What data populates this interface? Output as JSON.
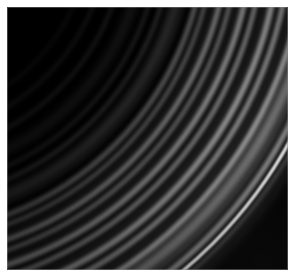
{
  "image": {
    "kind": "natural-image",
    "subject": "saturn-ring-system-closeup",
    "alt_text": "Grayscale spacecraft photograph of a portion of Saturn's ring system: many thin concentric bright arcs curving from the upper right down to the lower left across a black sky, with one very bright narrow outermost ringlet.",
    "orientation": "landscape",
    "width_px": 295,
    "height_px": 276,
    "color_mode": "grayscale",
    "background_color": "#000000",
    "frame_color": "#ffffff",
    "frame_inset_px": 7,
    "photo_width_px": 281,
    "photo_height_px": 263
  },
  "scene": {
    "arc_center_x": -112,
    "arc_center_y": -82,
    "description": "Concentric ring arcs share a common center off the upper-left of the frame; radius increases toward the lower-right, so bands sweep from top-right to bottom-left.",
    "space_color": "#000000",
    "brightest_ring_color": "#f2f2f2"
  },
  "rings": [
    {
      "name": "inner-faint-arc-1",
      "radius": 196,
      "width": 1.6,
      "brightness": 0.1,
      "blur": 2.2
    },
    {
      "name": "inner-faint-arc-2",
      "radius": 214,
      "width": 2.0,
      "brightness": 0.13,
      "blur": 2.4
    },
    {
      "name": "inner-faint-arc-3",
      "radius": 232,
      "width": 2.2,
      "brightness": 0.16,
      "blur": 2.4
    },
    {
      "name": "inner-dusty-band",
      "radius": 251,
      "width": 5.0,
      "brightness": 0.14,
      "blur": 4.0
    },
    {
      "name": "faint-ringlet-a",
      "radius": 266,
      "width": 2.0,
      "brightness": 0.22,
      "blur": 1.8
    },
    {
      "name": "faint-ringlet-b",
      "radius": 278,
      "width": 2.4,
      "brightness": 0.26,
      "blur": 1.8
    },
    {
      "name": "mid-broad-band",
      "radius": 292,
      "width": 7.0,
      "brightness": 0.24,
      "blur": 4.2
    },
    {
      "name": "gap-shadow-inner",
      "radius": 300,
      "width": 3.0,
      "brightness": 0.06,
      "blur": 2.0
    },
    {
      "name": "bright-band-1",
      "radius": 311,
      "width": 4.5,
      "brightness": 0.4,
      "blur": 2.2
    },
    {
      "name": "bright-band-2",
      "radius": 320,
      "width": 3.2,
      "brightness": 0.46,
      "blur": 1.8
    },
    {
      "name": "dark-gap-1",
      "radius": 327,
      "width": 2.6,
      "brightness": 0.14,
      "blur": 1.6
    },
    {
      "name": "bright-band-3",
      "radius": 334,
      "width": 5.0,
      "brightness": 0.52,
      "blur": 2.0
    },
    {
      "name": "bright-band-4",
      "radius": 344,
      "width": 4.0,
      "brightness": 0.48,
      "blur": 2.0
    },
    {
      "name": "dark-gap-2",
      "radius": 351,
      "width": 2.4,
      "brightness": 0.16,
      "blur": 1.6
    },
    {
      "name": "bright-band-5",
      "radius": 358,
      "width": 5.5,
      "brightness": 0.58,
      "blur": 2.2
    },
    {
      "name": "bright-band-6",
      "radius": 369,
      "width": 4.5,
      "brightness": 0.55,
      "blur": 2.0
    },
    {
      "name": "dark-gap-3",
      "radius": 377,
      "width": 2.8,
      "brightness": 0.18,
      "blur": 1.6
    },
    {
      "name": "bright-band-7",
      "radius": 385,
      "width": 6.0,
      "brightness": 0.62,
      "blur": 2.2
    },
    {
      "name": "bright-band-8",
      "radius": 396,
      "width": 5.0,
      "brightness": 0.6,
      "blur": 2.2
    },
    {
      "name": "dark-gap-4",
      "radius": 404,
      "width": 2.6,
      "brightness": 0.22,
      "blur": 1.6
    },
    {
      "name": "bright-band-9",
      "radius": 412,
      "width": 5.5,
      "brightness": 0.66,
      "blur": 2.0
    },
    {
      "name": "outer-broad-sheet",
      "radius": 424,
      "width": 10.0,
      "brightness": 0.55,
      "blur": 4.0
    },
    {
      "name": "dark-gap-outer",
      "radius": 434,
      "width": 3.0,
      "brightness": 0.24,
      "blur": 2.0
    },
    {
      "name": "f-ring-shoulder-inner",
      "radius": 442,
      "width": 5.0,
      "brightness": 0.62,
      "blur": 2.4
    },
    {
      "name": "f-ring-bright-core",
      "radius": 450,
      "width": 2.6,
      "brightness": 1.0,
      "blur": 0.9
    },
    {
      "name": "f-ring-shoulder-outer",
      "radius": 456,
      "width": 3.0,
      "brightness": 0.34,
      "blur": 2.6
    },
    {
      "name": "outer-halo",
      "radius": 463,
      "width": 6.0,
      "brightness": 0.1,
      "blur": 5.0
    }
  ],
  "labels": {
    "viewport_name": "image-viewport",
    "photo_name": "ring-photograph"
  }
}
